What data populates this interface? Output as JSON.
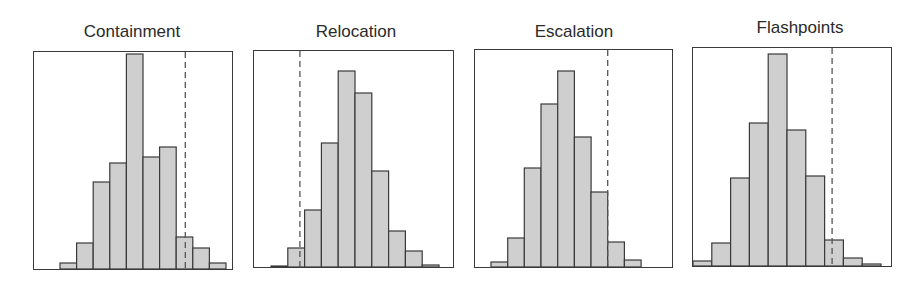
{
  "chart_data": [
    {
      "type": "bar",
      "subtype": "histogram",
      "title": "Containment",
      "xlabel": "",
      "ylabel": "",
      "grid": false,
      "legend": null,
      "bins": 10,
      "values": [
        6,
        26,
        87,
        106,
        215,
        112,
        122,
        32,
        21,
        6
      ],
      "reference_line": {
        "style": "dashed",
        "bin_position": 7.55
      },
      "box": {
        "x": 33,
        "y": 51,
        "w": 200,
        "h": 219
      },
      "bars_x0": 60,
      "bin_width": 16.6
    },
    {
      "type": "bar",
      "subtype": "histogram",
      "title": "Relocation",
      "xlabel": "",
      "ylabel": "",
      "grid": false,
      "legend": null,
      "bins": 10,
      "values": [
        1,
        19,
        57,
        124,
        196,
        174,
        96,
        36,
        16,
        2
      ],
      "reference_line": {
        "style": "dashed",
        "bin_position": 1.72
      },
      "box": {
        "x": 253,
        "y": 50,
        "w": 201,
        "h": 218
      },
      "bars_x0": 271,
      "bin_width": 16.8
    },
    {
      "type": "bar",
      "subtype": "histogram",
      "title": "Escalation",
      "xlabel": "",
      "ylabel": "",
      "grid": false,
      "legend": null,
      "bins": 9,
      "values": [
        5,
        29,
        99,
        163,
        196,
        130,
        75,
        25,
        7
      ],
      "reference_line": {
        "style": "dashed",
        "bin_position": 7.0
      },
      "box": {
        "x": 474,
        "y": 49,
        "w": 199,
        "h": 219
      },
      "bars_x0": 491,
      "bin_width": 16.67
    },
    {
      "type": "bar",
      "subtype": "histogram",
      "title": "Flashpoints",
      "xlabel": "",
      "ylabel": "",
      "grid": false,
      "legend": null,
      "bins": 10,
      "values": [
        5,
        23,
        88,
        143,
        212,
        136,
        90,
        26,
        8,
        2
      ],
      "reference_line": {
        "style": "dashed",
        "bin_position": 7.4
      },
      "box": {
        "x": 692,
        "y": 47,
        "w": 200,
        "h": 220
      },
      "bars_x0": 693,
      "bin_width": 18.8
    }
  ],
  "panels": [
    {
      "title": "Containment"
    },
    {
      "title": "Relocation"
    },
    {
      "title": "Escalation"
    },
    {
      "title": "Flashpoints"
    }
  ],
  "colors": {
    "bar_fill": "#cfcfcf",
    "bar_stroke": "#3a3a3a",
    "axis_box": "#3a3a3a",
    "reference_line": "#555555",
    "title_text": "#2a2a2a"
  },
  "title_positions": [
    {
      "center_x": 132,
      "top": 22
    },
    {
      "center_x": 356,
      "top": 22
    },
    {
      "center_x": 574,
      "top": 22
    },
    {
      "center_x": 800,
      "top": 18
    }
  ]
}
